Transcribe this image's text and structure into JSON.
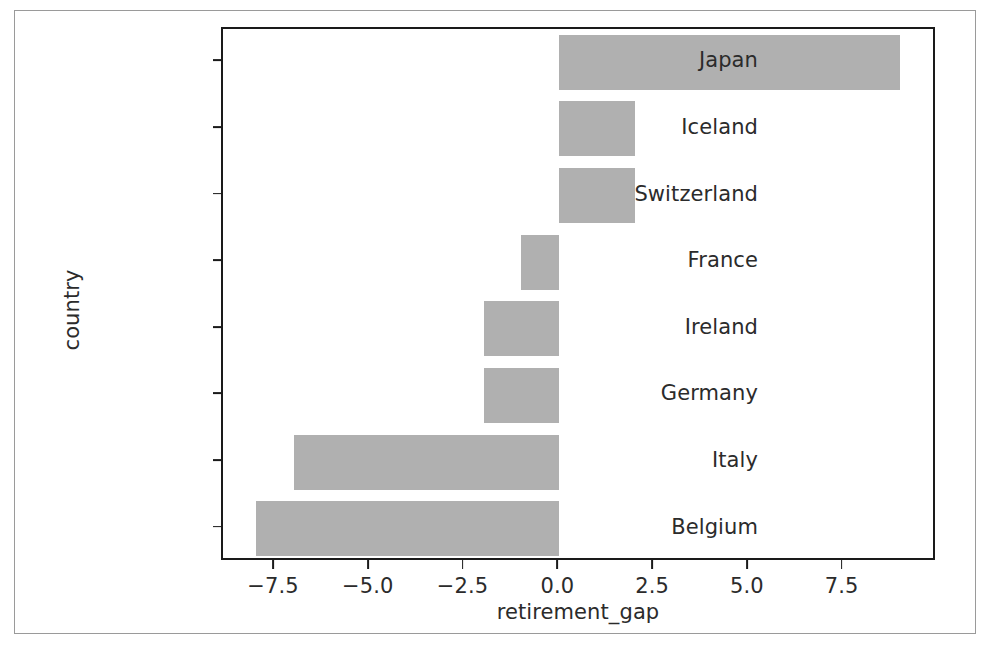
{
  "chart_data": {
    "type": "bar",
    "orientation": "horizontal",
    "title": "",
    "xlabel": "retirement_gap",
    "ylabel": "country",
    "categories": [
      "Japan",
      "Iceland",
      "Switzerland",
      "France",
      "Ireland",
      "Germany",
      "Italy",
      "Belgium"
    ],
    "values": [
      9.0,
      2.0,
      2.0,
      -1.0,
      -2.0,
      -2.0,
      -7.0,
      -8.0
    ],
    "xlim": [
      -8.85,
      10.0
    ],
    "xticks": [
      -7.5,
      -5.0,
      -2.5,
      0.0,
      2.5,
      5.0,
      7.5
    ],
    "xtick_labels": [
      "−7.5",
      "−5.0",
      "−2.5",
      "0.0",
      "2.5",
      "5.0",
      "7.5"
    ],
    "grid": false,
    "legend": null,
    "bar_color": "#b0b0b0",
    "axis_color": "#1a1a1a",
    "background": "#ffffff"
  },
  "figure": {
    "border_color": "#9a9a9a"
  }
}
